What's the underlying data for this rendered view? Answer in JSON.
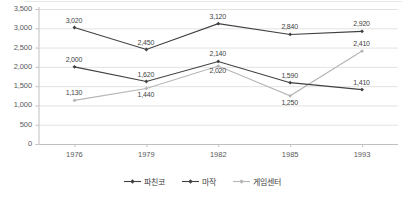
{
  "chart_data": {
    "type": "line",
    "title": "",
    "xlabel": "",
    "ylabel": "",
    "categories": [
      "1976",
      "1979",
      "1982",
      "1985",
      "1993"
    ],
    "ylim": [
      0,
      3500
    ],
    "ytick_labels": [
      "3,500",
      "3,000",
      "2,500",
      "2,000",
      "1,500",
      "1,000",
      "500",
      "0"
    ],
    "ytick_values": [
      3500,
      3000,
      2500,
      2000,
      1500,
      1000,
      500,
      0
    ],
    "grid": true,
    "legend_position": "bottom",
    "series": [
      {
        "name": "파친코",
        "color": "#404040",
        "values": [
          3020,
          2450,
          3120,
          2840,
          2920
        ],
        "labels": [
          "3,020",
          "2,450",
          "3,120",
          "2,840",
          "2,920"
        ]
      },
      {
        "name": "마작",
        "color": "#404040",
        "values": [
          2000,
          1620,
          2140,
          1590,
          1410
        ],
        "labels": [
          "2,000",
          "1,620",
          "2,140",
          "1,590",
          "1,410"
        ]
      },
      {
        "name": "게임센터",
        "color": "#b5b5b5",
        "values": [
          1130,
          1440,
          2020,
          1250,
          2410
        ],
        "labels": [
          "1,130",
          "1,440",
          "2,020",
          "1,250",
          "2,410"
        ]
      }
    ]
  },
  "style": {
    "grid_color": "#e3e3e3",
    "axis_color": "#bfbfbf",
    "plot_background": "#ffffff"
  }
}
